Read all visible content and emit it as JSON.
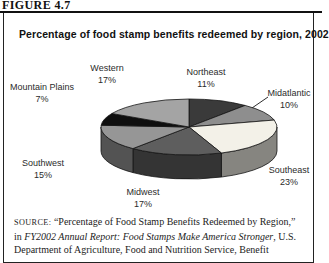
{
  "figure_label": "FIGURE 4.7",
  "chart_data": {
    "type": "pie",
    "title": "Percentage of food stamp benefits redeemed by region, 2002",
    "unit": "%",
    "total": 100,
    "start_angle_deg": 0,
    "clockwise_from_top": true,
    "style": "3d-grayscale",
    "slices": [
      {
        "label": "Northeast",
        "value": 11,
        "color": "#3a3a3a",
        "label_pos": [
          206,
          66
        ]
      },
      {
        "label": "Midatlantic",
        "value": 10,
        "color": "#8e8e8e",
        "label_pos": [
          289,
          87
        ],
        "leader": [
          268,
          97,
          252,
          108
        ]
      },
      {
        "label": "Southeast",
        "value": 23,
        "color": "#f3f1e8",
        "label_pos": [
          289,
          164
        ]
      },
      {
        "label": "Midwest",
        "value": 17,
        "color": "#5e5e5e",
        "label_pos": [
          143,
          186
        ]
      },
      {
        "label": "Southwest",
        "value": 15,
        "color": "#969696",
        "label_pos": [
          43,
          157
        ]
      },
      {
        "label": "Mountain Plains",
        "value": 7,
        "color": "#0f0f0f",
        "label_pos": [
          42,
          81
        ]
      },
      {
        "label": "Western",
        "value": 17,
        "color": "#a4a4a4",
        "label_pos": [
          107,
          62
        ]
      }
    ]
  },
  "source": {
    "label": "SOURCE:",
    "line1": " “Percentage of Food Stamp Benefits Redeemed by Region,”",
    "line2_prefix": "in ",
    "line2_italic": "FY2002 Annual Report: Food Stamps Make America Stronger",
    "line2_suffix": ", U.S.",
    "line3": "Department of Agriculture, Food and Nutrition Service, Benefit"
  }
}
